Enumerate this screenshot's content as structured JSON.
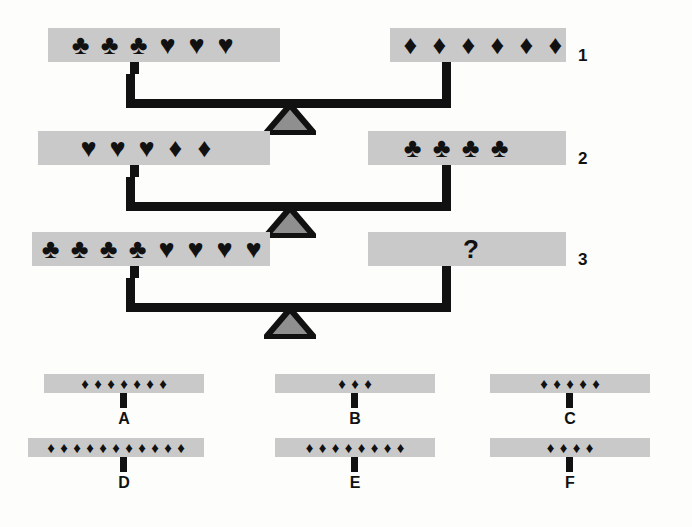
{
  "puzzle": {
    "title": "Balance scale reasoning puzzle",
    "question_mark": "?",
    "symbols": {
      "club": "♣",
      "heart": "♥",
      "diamond": "♦"
    },
    "colors": {
      "pan_fill": "#c9c9c9",
      "ink": "#111111",
      "fulcrum_fill": "#8f8f8f",
      "background": "#fdfdfc"
    },
    "scales": [
      {
        "number": "1",
        "left": {
          "glyphs": [
            "club",
            "club",
            "club",
            "heart",
            "heart",
            "heart"
          ]
        },
        "right": {
          "glyphs": [
            "diamond",
            "diamond",
            "diamond",
            "diamond",
            "diamond",
            "diamond"
          ]
        }
      },
      {
        "number": "2",
        "left": {
          "glyphs": [
            "heart",
            "heart",
            "heart",
            "diamond",
            "diamond"
          ]
        },
        "right": {
          "glyphs": [
            "club",
            "club",
            "club",
            "club"
          ]
        }
      },
      {
        "number": "3",
        "left": {
          "glyphs": [
            "club",
            "club",
            "club",
            "club",
            "heart",
            "heart",
            "heart",
            "heart"
          ]
        },
        "right": {
          "glyphs": [],
          "unknown": true
        }
      }
    ],
    "options": [
      {
        "label": "A",
        "glyphs": [
          "diamond",
          "diamond",
          "diamond",
          "diamond",
          "diamond",
          "diamond",
          "diamond"
        ]
      },
      {
        "label": "B",
        "glyphs": [
          "diamond",
          "diamond",
          "diamond"
        ]
      },
      {
        "label": "C",
        "glyphs": [
          "diamond",
          "diamond",
          "diamond",
          "diamond",
          "diamond"
        ]
      },
      {
        "label": "D",
        "glyphs": [
          "diamond",
          "diamond",
          "diamond",
          "diamond",
          "diamond",
          "diamond",
          "diamond",
          "diamond",
          "diamond",
          "diamond",
          "diamond"
        ]
      },
      {
        "label": "E",
        "glyphs": [
          "diamond",
          "diamond",
          "diamond",
          "diamond",
          "diamond",
          "diamond",
          "diamond",
          "diamond"
        ]
      },
      {
        "label": "F",
        "glyphs": [
          "diamond",
          "diamond",
          "diamond",
          "diamond"
        ]
      }
    ]
  }
}
